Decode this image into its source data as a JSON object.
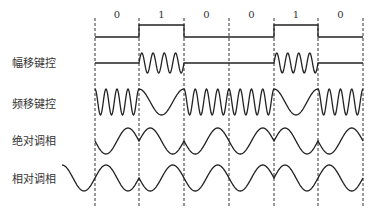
{
  "title": "",
  "bits": [
    "0",
    "1",
    "0",
    "0",
    "1",
    "0"
  ],
  "labels": {
    "ask": "幅移键控",
    "fsk": "频移键控",
    "psk_absolute": "绝对调相",
    "psk_relative": "相对调相"
  },
  "colors": {
    "line": "#222222",
    "dash": "#333333",
    "text": "#333333"
  },
  "layout": {
    "boundaries_x": [
      95,
      139,
      184,
      229,
      274,
      318,
      363
    ],
    "digital": {
      "low_y": 37,
      "high_y": 25
    },
    "ask": {
      "center_y": 63,
      "amp": 10
    },
    "fsk": {
      "center_y": 102,
      "amp": 13
    },
    "psk_abs": {
      "center_y": 141,
      "amp": 13
    },
    "psk_rel": {
      "center_y": 178,
      "amp": 13
    }
  }
}
